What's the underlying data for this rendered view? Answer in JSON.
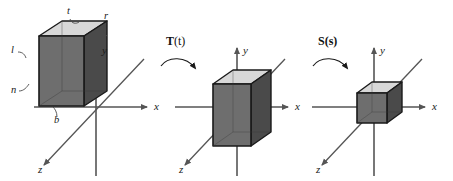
{
  "figure": {
    "background_color": "#ffffff",
    "width": 453,
    "height": 181
  },
  "colors": {
    "stroke": "#1a1a1a",
    "axis": "#555555",
    "face_front": "#6e6e6e",
    "face_right": "#4a4a4a",
    "face_top": "#d8d8d8",
    "text": "#1a1a1a"
  },
  "panels": [
    {
      "id": "panel-original",
      "name": "original-view-volume",
      "origin": {
        "x": 96,
        "y": 107
      },
      "axes": {
        "x": {
          "label": "x",
          "label_pos": {
            "x": 154,
            "y": 110
          }
        },
        "y": {
          "label": "y",
          "label_pos": {
            "x": 102,
            "y": 54
          }
        },
        "z": {
          "label": "z",
          "label_pos": {
            "x": 38,
            "y": 172
          }
        }
      },
      "box": {
        "name": "frustum-box-large",
        "width": 45,
        "height": 70,
        "depth": 22
      },
      "dimension_labels": [
        {
          "name": "label-t",
          "text": "t",
          "x": 67,
          "y": 14
        },
        {
          "name": "label-r",
          "text": "r",
          "x": 104,
          "y": 19
        },
        {
          "name": "label-l",
          "text": "l",
          "x": 11,
          "y": 53
        },
        {
          "name": "label-n",
          "text": "n",
          "x": 11,
          "y": 93
        },
        {
          "name": "label-b",
          "text": "b",
          "x": 54,
          "y": 123
        }
      ]
    },
    {
      "id": "panel-translated",
      "name": "translated-view-volume",
      "origin": {
        "x": 237,
        "y": 107
      },
      "axes": {
        "x": {
          "label": "x",
          "label_pos": {
            "x": 295,
            "y": 110
          }
        },
        "y": {
          "label": "y",
          "label_pos": {
            "x": 243,
            "y": 54
          }
        },
        "z": {
          "label": "z",
          "label_pos": {
            "x": 179,
            "y": 172
          }
        }
      },
      "box": {
        "name": "frustum-box-medium",
        "width": 38,
        "height": 62,
        "depth": 20
      },
      "operation": {
        "name": "translate-operation",
        "symbol": "T",
        "argument": "(t)",
        "bold_argument": false,
        "label_pos": {
          "x": 166,
          "y": 45
        },
        "arrow_start": {
          "x": 161,
          "y": 63
        },
        "arrow_end": {
          "x": 196,
          "y": 70
        }
      }
    },
    {
      "id": "panel-scaled",
      "name": "scaled-view-volume",
      "origin": {
        "x": 374,
        "y": 107
      },
      "axes": {
        "x": {
          "label": "x",
          "label_pos": {
            "x": 432,
            "y": 110
          }
        },
        "y": {
          "label": "y",
          "label_pos": {
            "x": 380,
            "y": 54
          }
        },
        "z": {
          "label": "z",
          "label_pos": {
            "x": 316,
            "y": 172
          }
        }
      },
      "box": {
        "name": "frustum-box-small",
        "width": 30,
        "height": 30,
        "depth": 16
      },
      "operation": {
        "name": "scale-operation",
        "symbol": "S",
        "argument": "(s)",
        "bold_argument": true,
        "label_pos": {
          "x": 318,
          "y": 45
        },
        "arrow_start": {
          "x": 313,
          "y": 63
        },
        "arrow_end": {
          "x": 348,
          "y": 70
        }
      }
    }
  ]
}
